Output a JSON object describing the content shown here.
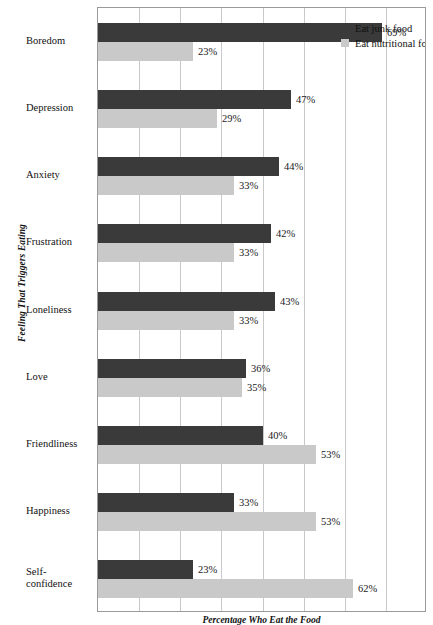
{
  "chart_data": {
    "type": "bar",
    "orientation": "horizontal",
    "title": "",
    "xlabel": "Percentage Who Eat the Food",
    "ylabel": "Feeling That Triggers Eating",
    "xlim": [
      0,
      80
    ],
    "xticks": [
      0,
      10,
      20,
      30,
      40,
      50,
      60,
      70,
      80
    ],
    "grid": true,
    "legend_position": "top-right",
    "value_suffix": "%",
    "categories": [
      "Boredom",
      "Depression",
      "Anxiety",
      "Frustration",
      "Loneliness",
      "Love",
      "Friendliness",
      "Happiness",
      "Self-confidence"
    ],
    "series": [
      {
        "name": "Eat junk food",
        "color": "#3a3a3a",
        "values": [
          69,
          47,
          44,
          42,
          43,
          36,
          40,
          33,
          23
        ],
        "labels": [
          "69%",
          "47%",
          "44%",
          "42%",
          "43%",
          "36%",
          "40%",
          "33%",
          "23%"
        ]
      },
      {
        "name": "Eat nutritional food only",
        "color": "#c9c9c9",
        "values": [
          23,
          29,
          33,
          33,
          33,
          35,
          53,
          53,
          62
        ],
        "labels": [
          "23%",
          "29%",
          "33%",
          "33%",
          "33%",
          "35%",
          "53%",
          "53%",
          "62%"
        ]
      }
    ]
  },
  "category_labels": [
    {
      "line1": "Boredom",
      "line2": ""
    },
    {
      "line1": "Depression",
      "line2": ""
    },
    {
      "line1": "Anxiety",
      "line2": ""
    },
    {
      "line1": "Frustration",
      "line2": ""
    },
    {
      "line1": "Loneliness",
      "line2": ""
    },
    {
      "line1": "Love",
      "line2": ""
    },
    {
      "line1": "Friendliness",
      "line2": ""
    },
    {
      "line1": "Happiness",
      "line2": ""
    },
    {
      "line1": "Self-",
      "line2": "confidence"
    }
  ],
  "legend": {
    "items": [
      {
        "label": "Eat junk food",
        "color": "#3a3a3a"
      },
      {
        "label": "Eat nutritional food only",
        "color": "#c9c9c9"
      }
    ]
  },
  "axis_titles": {
    "y": "Feeling That Triggers Eating",
    "x": "Percentage Who Eat the Food"
  }
}
